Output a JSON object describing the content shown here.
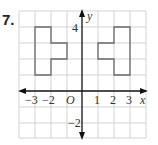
{
  "problem_number": "7.",
  "graph": {
    "x_axis_label": "x",
    "y_axis_label": "y",
    "origin_label": "O",
    "x_range": [
      -4,
      4
    ],
    "y_range": [
      -3,
      5
    ],
    "x_tick_labels": [
      "−3",
      "−2",
      "1",
      "2",
      "3"
    ],
    "y_tick_labels": [
      "4",
      "−2"
    ],
    "shapes": [
      {
        "name": "left-figure",
        "vertices": [
          [
            -3,
            4
          ],
          [
            -2,
            4
          ],
          [
            -2,
            3
          ],
          [
            -1,
            3
          ],
          [
            -1,
            2
          ],
          [
            -2,
            2
          ],
          [
            -2,
            1
          ],
          [
            -3,
            1
          ]
        ]
      },
      {
        "name": "right-figure",
        "vertices": [
          [
            2,
            4
          ],
          [
            3,
            4
          ],
          [
            3,
            1
          ],
          [
            2,
            1
          ],
          [
            2,
            2
          ],
          [
            1,
            2
          ],
          [
            1,
            3
          ],
          [
            2,
            3
          ]
        ]
      }
    ],
    "colors": {
      "grid": "#c8c8c8",
      "axis": "#111111",
      "shape": "#6a6a6a"
    }
  }
}
